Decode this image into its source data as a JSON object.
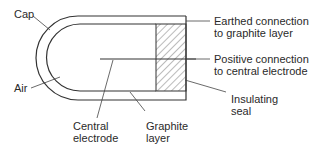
{
  "diagram": {
    "type": "cross-section of electrode assembly",
    "colors": {
      "stroke": "#333333",
      "background": "#ffffff",
      "text": "#2a2a2a"
    },
    "labels": {
      "cap": "Cap",
      "air": "Air",
      "central_electrode_1": "Central",
      "central_electrode_2": "electrode",
      "graphite_layer_1": "Graphite",
      "graphite_layer_2": "layer",
      "earthed_1": "Earthed connection",
      "earthed_2": "to graphite layer",
      "positive_1": "Positive connection",
      "positive_2": "to central electrode",
      "seal_1": "Insulating",
      "seal_2": "seal"
    }
  }
}
